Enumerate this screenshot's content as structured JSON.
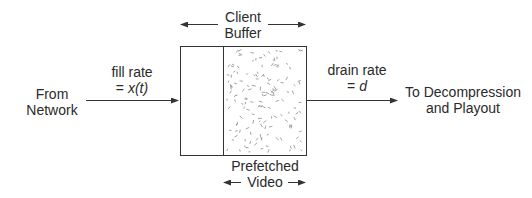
{
  "diagram": {
    "buffer_label": {
      "line1": "Client",
      "line2": "Buffer"
    },
    "prefetched_label": {
      "line1": "Prefetched",
      "line2": "Video"
    },
    "input": {
      "source_line1": "From",
      "source_line2": "Network",
      "rate_line1": "fill rate",
      "rate_prefix": "= ",
      "rate_var": "x(t)"
    },
    "output": {
      "rate_line1": "drain rate",
      "rate_prefix": "= ",
      "rate_var": "d",
      "dest_line1": "To Decompression",
      "dest_line2": "and Playout"
    },
    "colors": {
      "line": "#333333",
      "hatch": "#8a8a8a",
      "text": "#2a2a2a"
    }
  }
}
